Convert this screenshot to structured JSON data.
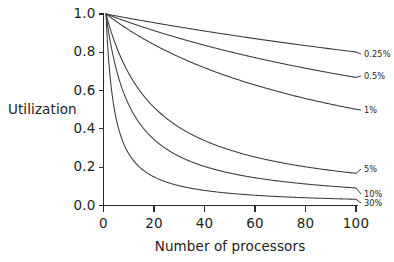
{
  "chart_data": {
    "type": "line",
    "title": "",
    "subtitle": "",
    "xlabel": "Number of processors",
    "ylabel": "Utilization",
    "xlim": [
      0,
      100
    ],
    "ylim": [
      0.0,
      1.0
    ],
    "grid": false,
    "legend_position": "right-inline-labels",
    "xticks": [
      "0",
      "20",
      "40",
      "60",
      "80",
      "100"
    ],
    "xtick_values": [
      0,
      20,
      40,
      60,
      80,
      100
    ],
    "yticks": [
      "0.0",
      "0.2",
      "0.4",
      "0.6",
      "0.8",
      "1.0"
    ],
    "ytick_values": [
      0.0,
      0.2,
      0.4,
      0.6,
      0.8,
      1.0
    ],
    "x": [
      1,
      5,
      10,
      15,
      20,
      25,
      30,
      35,
      40,
      45,
      50,
      55,
      60,
      65,
      70,
      75,
      80,
      85,
      90,
      95,
      100
    ],
    "series": [
      {
        "name": "0.25%",
        "fraction": 0.0025,
        "values": [
          1.0,
          0.99,
          0.978,
          0.966,
          0.954,
          0.943,
          0.932,
          0.921,
          0.911,
          0.901,
          0.891,
          0.881,
          0.871,
          0.862,
          0.853,
          0.844,
          0.835,
          0.826,
          0.818,
          0.81,
          0.802
        ]
      },
      {
        "name": "0.5%",
        "fraction": 0.005,
        "values": [
          1.0,
          0.98,
          0.957,
          0.935,
          0.913,
          0.893,
          0.873,
          0.855,
          0.837,
          0.82,
          0.803,
          0.787,
          0.772,
          0.758,
          0.744,
          0.73,
          0.717,
          0.704,
          0.692,
          0.68,
          0.669
        ]
      },
      {
        "name": "1%",
        "fraction": 0.01,
        "values": [
          1.0,
          0.962,
          0.917,
          0.877,
          0.84,
          0.806,
          0.775,
          0.746,
          0.719,
          0.694,
          0.671,
          0.649,
          0.629,
          0.61,
          0.592,
          0.575,
          0.559,
          0.543,
          0.529,
          0.515,
          0.502
        ]
      },
      {
        "name": "5%",
        "fraction": 0.05,
        "values": [
          1.0,
          0.833,
          0.69,
          0.588,
          0.513,
          0.455,
          0.408,
          0.37,
          0.339,
          0.313,
          0.29,
          0.27,
          0.253,
          0.238,
          0.225,
          0.213,
          0.202,
          0.192,
          0.183,
          0.175,
          0.168
        ]
      },
      {
        "name": "10%",
        "fraction": 0.1,
        "values": [
          1.0,
          0.714,
          0.526,
          0.417,
          0.345,
          0.294,
          0.256,
          0.227,
          0.204,
          0.185,
          0.169,
          0.156,
          0.145,
          0.135,
          0.127,
          0.119,
          0.112,
          0.106,
          0.101,
          0.096,
          0.092
        ]
      },
      {
        "name": "30%",
        "fraction": 0.3,
        "values": [
          1.0,
          0.455,
          0.256,
          0.179,
          0.138,
          0.112,
          0.094,
          0.081,
          0.071,
          0.063,
          0.057,
          0.052,
          0.048,
          0.044,
          0.041,
          0.038,
          0.036,
          0.034,
          0.032,
          0.03,
          0.029
        ]
      }
    ],
    "series_labels": [
      {
        "name": "0.25%"
      },
      {
        "name": "0.5%"
      },
      {
        "name": "1%"
      },
      {
        "name": "5%"
      },
      {
        "name": "10%"
      },
      {
        "name": "30%"
      }
    ],
    "colors": {
      "background": "#ffffff",
      "axis": "#2b2b2b",
      "curve": "#3a3a3a",
      "text": "#1d1d1d"
    },
    "formula_note": "U = 1 / (1 + f * (N - 1))"
  }
}
